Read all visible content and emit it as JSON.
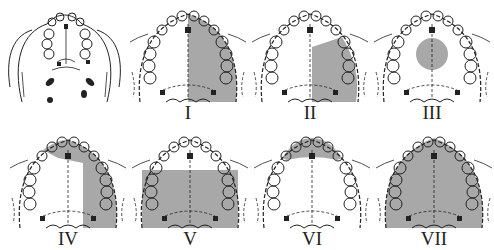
{
  "figure": {
    "shade_color": "#a8a8a8",
    "line_color": "#222222",
    "panels": [
      {
        "id": "ref",
        "label": "",
        "shade": "none"
      },
      {
        "id": "I",
        "label": "I",
        "shade": "right-hemipalate"
      },
      {
        "id": "II",
        "label": "II",
        "shade": "right-posterior-partial"
      },
      {
        "id": "III",
        "label": "III",
        "shade": "central-circle"
      },
      {
        "id": "IV",
        "label": "IV",
        "shade": "right-hemipalate-plus-anterior"
      },
      {
        "id": "V",
        "label": "V",
        "shade": "bilateral-posterior"
      },
      {
        "id": "VI",
        "label": "VI",
        "shade": "anterior-premaxilla"
      },
      {
        "id": "VII",
        "label": "VII",
        "shade": "total-palate"
      }
    ]
  }
}
